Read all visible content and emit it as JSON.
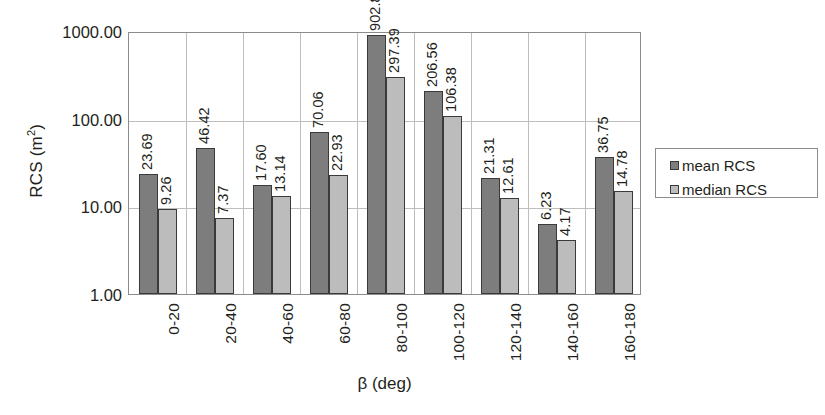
{
  "chart_data": {
    "type": "bar",
    "title": "",
    "xlabel": "β (deg)",
    "ylabel": "RCS (m²)",
    "yscale": "log",
    "ylim": [
      1,
      1000
    ],
    "ytick_labels": [
      "1000.00",
      "100.00",
      "10.00",
      "1.00"
    ],
    "ytick_values": [
      1000,
      100,
      10,
      1
    ],
    "grid": true,
    "legend_position": "right",
    "categories": [
      "0-20",
      "20-40",
      "40-60",
      "60-80",
      "80-100",
      "100-120",
      "120-140",
      "140-160",
      "160-180"
    ],
    "series": [
      {
        "name": "mean RCS",
        "color": "#7d7d7d",
        "values": [
          23.69,
          46.42,
          17.6,
          70.06,
          902.87,
          206.56,
          21.31,
          6.23,
          36.75
        ],
        "labels": [
          "23.69",
          "46.42",
          "17.60",
          "70.06",
          "902.87",
          "206.56",
          "21.31",
          "6.23",
          "36.75"
        ]
      },
      {
        "name": "median RCS",
        "color": "#bcbcbc",
        "values": [
          9.26,
          7.37,
          13.14,
          22.93,
          297.39,
          106.38,
          12.61,
          4.17,
          14.78
        ],
        "labels": [
          "9.26",
          "7.37",
          "13.14",
          "22.93",
          "297.39",
          "106.38",
          "12.61",
          "4.17",
          "14.78"
        ]
      }
    ]
  },
  "axis": {
    "y_title_main": "RCS (m",
    "y_title_sup": "2",
    "y_title_close": ")",
    "x_title": "β (deg)"
  },
  "legend": {
    "items": [
      {
        "label": "mean RCS",
        "color": "#7d7d7d"
      },
      {
        "label": "median RCS",
        "color": "#bcbcbc"
      }
    ]
  }
}
